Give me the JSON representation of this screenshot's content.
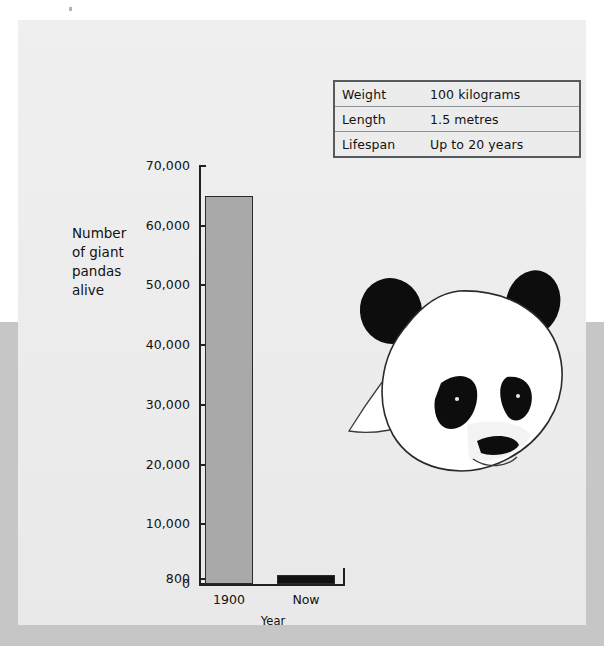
{
  "document": {
    "title": "Giant panda fact sheet",
    "background_color": "#eeeeee",
    "band_color": "#c6c6c6"
  },
  "fact_table": {
    "name": "panda-fact-table",
    "rows": [
      {
        "label": "Weight",
        "value": "100 kilograms"
      },
      {
        "label": "Length",
        "value": "1.5 metres"
      },
      {
        "label": "Lifespan",
        "value": "Up to 20 years"
      }
    ]
  },
  "illustration": {
    "name": "panda-head-illustration",
    "description": "Giant panda head drawing",
    "fur_color": "#ffffff",
    "patch_color": "#0d0d0d",
    "outline_color": "#2a2a2a"
  },
  "chart_labels": {
    "y_axis_title_lines": [
      "Number",
      "of giant",
      "pandas",
      "alive"
    ],
    "x_axis_title": "Year"
  },
  "chart_data": {
    "type": "bar",
    "title": "",
    "xlabel": "Year",
    "ylabel": "Number of giant pandas alive",
    "categories": [
      "1900",
      "Now"
    ],
    "values": [
      65000,
      800
    ],
    "ylim": [
      0,
      70000
    ],
    "yticks": [
      0,
      800,
      10000,
      20000,
      30000,
      40000,
      50000,
      60000,
      70000
    ],
    "ytick_labels": [
      "0",
      "800",
      "10,000",
      "20,000",
      "30,000",
      "40,000",
      "50,000",
      "60,000",
      "70,000"
    ],
    "grid": false,
    "legend": "none",
    "bar_colors": [
      "#a9a9a9",
      "#111111"
    ]
  }
}
